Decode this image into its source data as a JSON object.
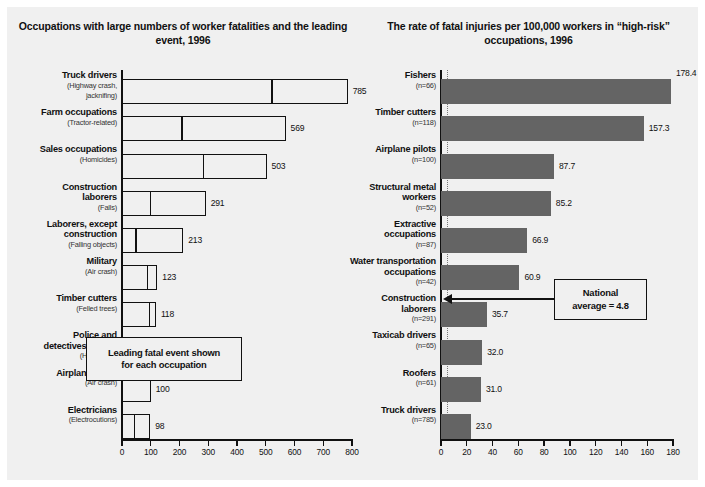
{
  "figure": {
    "background": "#f0f0f0",
    "bar_color": "#646464",
    "outline_color": "#111111"
  },
  "chart_data": [
    {
      "id": "left",
      "type": "bar",
      "orientation": "horizontal",
      "title": "Occupations with large numbers of worker fatalities and the leading event, 1996",
      "title_line1": "Occupations with large numbers of worker",
      "title_line2": "fatalities and the leading event, 1996",
      "xlabel": "",
      "ylabel": "",
      "xlim": [
        0,
        800
      ],
      "xticks": [
        0,
        100,
        200,
        300,
        400,
        500,
        600,
        700,
        800
      ],
      "xtick_labels": [
        "0",
        "100",
        "200",
        "300",
        "400",
        "500",
        "600",
        "700",
        "800"
      ],
      "grid": false,
      "legend": "none",
      "annotation": {
        "line1": "Leading fatal event shown",
        "line2": "for each occupation"
      },
      "categories": [
        "Truck drivers",
        "Farm occupations",
        "Sales occupations",
        "Construction laborers",
        "Laborers, except construction",
        "Military",
        "Timber cutters",
        "Police and detectives, public",
        "Airplane pilots",
        "Electricians"
      ],
      "values": [
        785,
        569,
        503,
        291,
        213,
        123,
        118,
        114,
        100,
        98
      ],
      "bars": [
        {
          "label_lines": [
            "Truck drivers"
          ],
          "event_lines": [
            "(Highway crash,",
            "jacknifing)"
          ],
          "value": 785,
          "value_label": "785",
          "event_split": 520
        },
        {
          "label_lines": [
            "Farm occupations"
          ],
          "event_lines": [
            "(Tractor-related)"
          ],
          "value": 569,
          "value_label": "569",
          "event_split": 208
        },
        {
          "label_lines": [
            "Sales occupations"
          ],
          "event_lines": [
            "(Homicides)"
          ],
          "value": 503,
          "value_label": "503",
          "event_split": 283
        },
        {
          "label_lines": [
            "Construction",
            "laborers"
          ],
          "event_lines": [
            "(Falls)"
          ],
          "value": 291,
          "value_label": "291",
          "event_split": 99
        },
        {
          "label_lines": [
            "Laborers, except",
            "construction"
          ],
          "event_lines": [
            "(Falling objects)"
          ],
          "value": 213,
          "value_label": "213",
          "event_split": 47
        },
        {
          "label_lines": [
            "Military"
          ],
          "event_lines": [
            "(Air crash)"
          ],
          "value": 123,
          "value_label": "123",
          "event_split": 88
        },
        {
          "label_lines": [
            "Timber cutters"
          ],
          "event_lines": [
            "(Felled trees)"
          ],
          "value": 118,
          "value_label": "118",
          "event_split": 94
        },
        {
          "label_lines": [
            "Police and",
            "detectives, public"
          ],
          "event_lines": [
            "(Homicides)"
          ],
          "value": 114,
          "value_label": "114",
          "event_split": 52
        },
        {
          "label_lines": [
            "Airplane pilots"
          ],
          "event_lines": [
            "(Air crash)"
          ],
          "value": 100,
          "value_label": "100",
          "event_split": null
        },
        {
          "label_lines": [
            "Electricians"
          ],
          "event_lines": [
            "(Electrocutions)"
          ],
          "value": 98,
          "value_label": "98",
          "event_split": 43
        }
      ]
    },
    {
      "id": "right",
      "type": "bar",
      "orientation": "horizontal",
      "title": "The rate of fatal injuries per 100,000 workers in “high-risk” occupations, 1996",
      "title_line1": "The rate of fatal injuries per 100,000 workers",
      "title_line2": "in “high-risk” occupations, 1996",
      "xlabel": "",
      "ylabel": "",
      "xlim": [
        0,
        180
      ],
      "xticks": [
        0,
        20,
        40,
        60,
        80,
        100,
        120,
        140,
        160,
        180
      ],
      "xtick_labels": [
        "0",
        "20",
        "40",
        "60",
        "80",
        "100",
        "120",
        "140",
        "160",
        "180"
      ],
      "grid": false,
      "legend": "none",
      "reference_line": {
        "value": 4.8,
        "label_line1": "National",
        "label_line2": "average = 4.8",
        "style": "dotted"
      },
      "categories": [
        "Fishers",
        "Timber cutters",
        "Airplane pilots",
        "Structural metal workers",
        "Extractive occupations",
        "Water transportation occupations",
        "Construction laborers",
        "Taxicab drivers",
        "Roofers",
        "Truck drivers"
      ],
      "values": [
        178.4,
        157.3,
        87.7,
        85.2,
        66.9,
        60.9,
        35.7,
        32.0,
        31.0,
        23.0
      ],
      "bars": [
        {
          "label_lines": [
            "Fishers"
          ],
          "n_label": "(n=66)",
          "value": 178.4,
          "value_label": "178.4"
        },
        {
          "label_lines": [
            "Timber cutters"
          ],
          "n_label": "(n=118)",
          "value": 157.3,
          "value_label": "157.3"
        },
        {
          "label_lines": [
            "Airplane pilots"
          ],
          "n_label": "(n=100)",
          "value": 87.7,
          "value_label": "87.7"
        },
        {
          "label_lines": [
            "Structural metal",
            "workers"
          ],
          "n_label": "(n=52)",
          "value": 85.2,
          "value_label": "85.2"
        },
        {
          "label_lines": [
            "Extractive",
            "occupations"
          ],
          "n_label": "(n=87)",
          "value": 66.9,
          "value_label": "66.9"
        },
        {
          "label_lines": [
            "Water transportation",
            "occupations"
          ],
          "n_label": "(n=42)",
          "value": 60.9,
          "value_label": "60.9"
        },
        {
          "label_lines": [
            "Construction",
            "laborers"
          ],
          "n_label": "(n=291)",
          "value": 35.7,
          "value_label": "35.7"
        },
        {
          "label_lines": [
            "Taxicab drivers"
          ],
          "n_label": "(n=65)",
          "value": 32.0,
          "value_label": "32.0"
        },
        {
          "label_lines": [
            "Roofers"
          ],
          "n_label": "(n=61)",
          "value": 31.0,
          "value_label": "31.0"
        },
        {
          "label_lines": [
            "Truck drivers"
          ],
          "n_label": "(n=785)",
          "value": 23.0,
          "value_label": "23.0"
        }
      ]
    }
  ]
}
